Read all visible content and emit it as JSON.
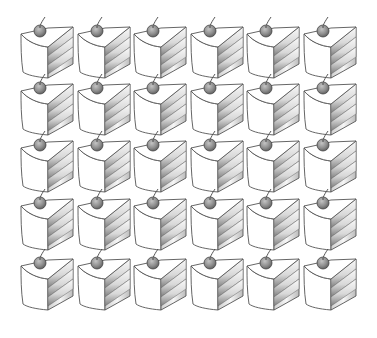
{
  "image": {
    "description": "Grid of identical cake slice clipart icons, each topped with a cherry",
    "item_icon": "cake-slice-with-cherry-icon",
    "rows": 5,
    "columns": 6,
    "total_items": 30
  },
  "layout": {
    "origin_x": 18,
    "origin_y": 14,
    "col_pitch": 56.5,
    "row_pitch": 60
  },
  "colors": {
    "background": "#ffffff",
    "outline": "#555555",
    "cake_face": "#ffffff",
    "layer_light": "#f2f2f2",
    "layer_dark": "#8a8a8a",
    "cherry": "#8c8c8c",
    "cherry_highlight": "#bdbdbd",
    "stem": "#444444"
  }
}
